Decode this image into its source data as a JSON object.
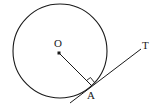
{
  "diagram": {
    "labels": {
      "center": "O",
      "tangent_point": "A",
      "tangent_end": "T"
    },
    "colors": {
      "stroke": "#1a1a1a",
      "background": "#ffffff"
    },
    "elements": {
      "circle": {
        "cx": 60,
        "cy": 51,
        "r": 47
      },
      "center_dot": {
        "cx": 59,
        "cy": 53
      },
      "radius": {
        "x1": 59,
        "y1": 53,
        "x2": 92,
        "y2": 86
      },
      "tangent": {
        "x1": 70,
        "y1": 103,
        "x2": 141,
        "y2": 49
      },
      "right_angle_marker": true
    }
  }
}
